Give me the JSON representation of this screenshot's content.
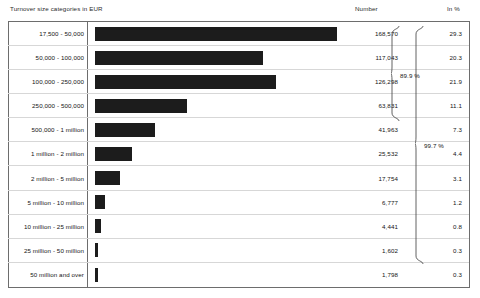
{
  "header": {
    "categories_label": "Turnover size categories in EUR",
    "number_label": "Number",
    "percent_label": "In %"
  },
  "chart_data": {
    "type": "bar",
    "title": "Turnover size categories in EUR",
    "xlabel": "",
    "ylabel": "Turnover size categories in EUR",
    "orientation": "horizontal",
    "grid": false,
    "legend": "none",
    "xlim": [
      0,
      168570
    ],
    "categories": [
      "17,500 - 50,000",
      "50,000 - 100,000",
      "100,000 - 250,000",
      "250,000 - 500,000",
      "500,000 - 1 million",
      "1 million - 2 million",
      "2 million - 5 million",
      "5 million - 10 million",
      "10 million - 25 million",
      "25 million - 50 million",
      "50 million and over"
    ],
    "values": [
      168570,
      117043,
      126298,
      63831,
      41963,
      25532,
      17754,
      6777,
      4441,
      1602,
      1798
    ],
    "value_labels": [
      "168,570",
      "117,043",
      "126,298",
      "63,831",
      "41,963",
      "25,532",
      "17,754",
      "6,777",
      "4,441",
      "1,602",
      "1,798"
    ],
    "percent_labels": [
      "29.3",
      "20.3",
      "21.9",
      "11.1",
      "7.3",
      "4.4",
      "3.1",
      "1.2",
      "0.8",
      "0.3",
      "0.3"
    ],
    "percents": [
      29.3,
      20.3,
      21.9,
      11.1,
      7.3,
      4.4,
      3.1,
      1.2,
      0.8,
      0.3,
      0.3
    ],
    "bar_color": "#1c1c1c",
    "annotations": [
      {
        "label": "89.9 %",
        "spans_rows": [
          1,
          5
        ]
      },
      {
        "label": "99.7 %",
        "spans_rows": [
          1,
          10
        ]
      }
    ]
  },
  "rows": [
    {
      "label": "17,500 - 50,000",
      "number": "168,570",
      "percent": "29.3"
    },
    {
      "label": "50,000 - 100,000",
      "number": "117,043",
      "percent": "20.3"
    },
    {
      "label": "100,000 - 250,000",
      "number": "126,298",
      "percent": "21.9"
    },
    {
      "label": "250,000 - 500,000",
      "number": "63,831",
      "percent": "11.1"
    },
    {
      "label": "500,000 - 1 million",
      "number": "41,963",
      "percent": "7.3"
    },
    {
      "label": "1 million - 2 million",
      "number": "25,532",
      "percent": "4.4"
    },
    {
      "label": "2 million - 5 million",
      "number": "17,754",
      "percent": "3.1"
    },
    {
      "label": "5 million - 10 million",
      "number": "6,777",
      "percent": "1.2"
    },
    {
      "label": "10 million - 25 million",
      "number": "4,441",
      "percent": "0.8"
    },
    {
      "label": "25 million - 50 million",
      "number": "1,602",
      "percent": "0.3"
    },
    {
      "label": "50 million and over",
      "number": "1,798",
      "percent": "0.3"
    }
  ],
  "braces": {
    "upper": "89.9 %",
    "lower": "99.7 %"
  }
}
